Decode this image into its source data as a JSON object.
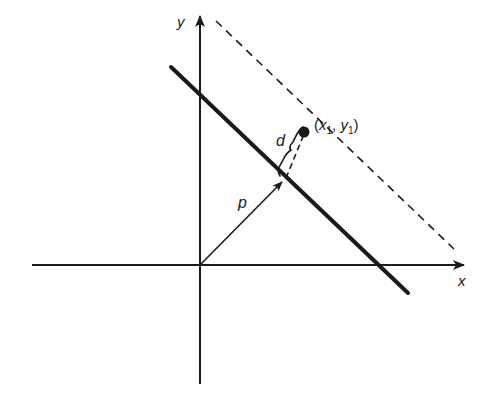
{
  "diagram": {
    "type": "geometry",
    "colors": {
      "ink": "#1a1a1a",
      "background": "#ffffff"
    },
    "axes": {
      "x_label": "x",
      "y_label": "y",
      "origin": [
        200,
        265
      ],
      "x_axis": {
        "from": [
          32,
          265
        ],
        "to": [
          466,
          265
        ]
      },
      "y_axis": {
        "from": [
          200,
          384
        ],
        "to": [
          200,
          14
        ]
      }
    },
    "line": {
      "style": "solid-thick",
      "from": [
        171,
        67
      ],
      "to": [
        408,
        293
      ]
    },
    "parallel_line": {
      "style": "dashed",
      "from": [
        216,
        21
      ],
      "to": [
        454,
        249
      ]
    },
    "normal_vector": {
      "label": "p",
      "from": [
        200,
        265
      ],
      "to": [
        284,
        180
      ]
    },
    "distance_segment": {
      "label": "d",
      "style": "dashed",
      "from": [
        284,
        180
      ],
      "to": [
        304,
        132
      ]
    },
    "point": {
      "label_x": "x",
      "label_x_sub": "1",
      "label_y": "y",
      "label_y_sub": "1",
      "position": [
        304,
        132
      ]
    }
  }
}
